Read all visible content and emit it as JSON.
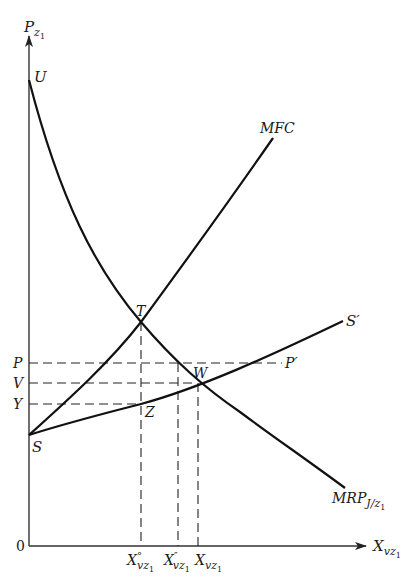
{
  "diagram": {
    "axes": {
      "y_label_main": "P",
      "y_label_sub": "z",
      "y_label_subsub": "1",
      "x_label_main": "X",
      "x_label_sub": "vz",
      "x_label_subsub": "1",
      "origin": "0"
    },
    "curves": {
      "mrp": {
        "label_main": "MRP",
        "label_sub": "J/z",
        "label_subsub": "1",
        "start_point": "U"
      },
      "mfc": {
        "label": "MFC"
      },
      "supply": {
        "start_point": "S",
        "end_label": "S′"
      }
    },
    "points": {
      "T": "T",
      "W": "W",
      "Z": "Z",
      "U": "U",
      "S": "S"
    },
    "price_levels": {
      "P": "P",
      "P_prime": "P′",
      "V": "V",
      "Y": "Y"
    },
    "quantity_levels": [
      {
        "main": "X",
        "mark": "°",
        "sub": "vz",
        "subsub": "1"
      },
      {
        "main": "X",
        "mark": "″",
        "sub": "vz",
        "subsub": "1"
      },
      {
        "main": "X",
        "mark": "",
        "sub": "vz",
        "subsub": "1"
      }
    ],
    "colors": {
      "ink": "#111111",
      "background": "#ffffff"
    }
  }
}
